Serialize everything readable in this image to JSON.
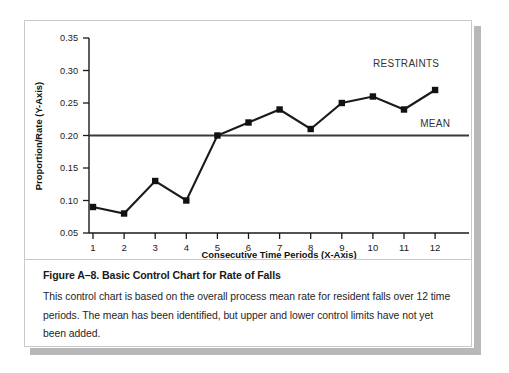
{
  "figure": {
    "caption_title": "Figure A–8. Basic Control Chart for Rate of Falls",
    "caption_body": "This control chart is based on the overall process mean rate for resident falls over 12 time periods. The mean has been identified, but upper and lower control limits have not yet been added."
  },
  "colors": {
    "series_line": "#1a1a1a",
    "marker": "#111111",
    "mean_line": "#3a3a3a",
    "axis": "#1a1a1a",
    "panel_border": "#c9c9c9",
    "shadow": "#b8b8b8",
    "background": "#ffffff"
  },
  "chart_data": {
    "type": "line",
    "title": "",
    "xlabel": "Consecutive Time Periods (X-Axis)",
    "ylabel": "Proportion/Rate (Y-Axis)",
    "x": [
      1,
      2,
      3,
      4,
      5,
      6,
      7,
      8,
      9,
      10,
      11,
      12
    ],
    "categories": [
      "1",
      "2",
      "3",
      "4",
      "5",
      "6",
      "7",
      "8",
      "9",
      "10",
      "11",
      "12"
    ],
    "xtick_labels": [
      "1",
      "2",
      "3",
      "4",
      "5",
      "6",
      "7",
      "8",
      "9",
      "10",
      "11",
      "12"
    ],
    "ytick_labels": [
      "0.05",
      "0.10",
      "0.15",
      "0.20",
      "0.25",
      "0.30",
      "0.35"
    ],
    "yticks": [
      0.05,
      0.1,
      0.15,
      0.2,
      0.25,
      0.3,
      0.35
    ],
    "ylim": [
      0.05,
      0.35
    ],
    "xlim": [
      0.5,
      12.5
    ],
    "grid": false,
    "legend": "none",
    "series": [
      {
        "name": "RESTRAINTS",
        "label": "RESTRAINTS",
        "marker": "square",
        "values": [
          0.09,
          0.08,
          0.13,
          0.1,
          0.2,
          0.22,
          0.24,
          0.21,
          0.25,
          0.26,
          0.24,
          0.27
        ]
      }
    ],
    "reference_lines": [
      {
        "name": "MEAN",
        "label": "MEAN",
        "value": 0.2,
        "orientation": "horizontal"
      }
    ],
    "annotations": [
      {
        "text": "RESTRAINTS",
        "x": 11.3,
        "y": 0.305
      },
      {
        "text": "MEAN",
        "x": 12.2,
        "y": 0.213
      }
    ]
  }
}
